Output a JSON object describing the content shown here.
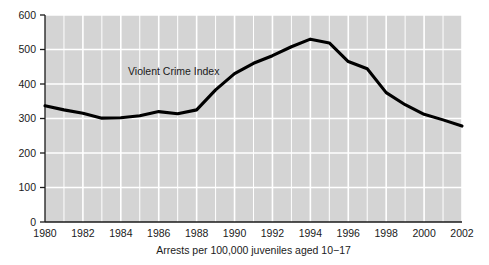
{
  "figure": {
    "background_color": "#ffffff",
    "plot_background_color": "#d4d4d4",
    "gridline_color": "#ffffff",
    "axis_color": "#1a1a1a",
    "series_color": "#000000"
  },
  "annotations": {
    "series_label": "Violent Crime Index"
  },
  "axes": {
    "x_title": "Arrests per 100,000 juveniles aged 10−17",
    "y_title": "",
    "y_tick_labels": [
      "0",
      "100",
      "200",
      "300",
      "400",
      "500",
      "600"
    ],
    "x_tick_labels": [
      "1980",
      "1982",
      "1984",
      "1986",
      "1988",
      "1990",
      "1992",
      "1994",
      "1996",
      "1998",
      "2000",
      "2002"
    ]
  },
  "chart_data": {
    "type": "line",
    "title": "",
    "subtitle": "",
    "xlabel": "Arrests per 100,000 juveniles aged 10−17",
    "ylabel": "",
    "xlim": [
      1980,
      2002
    ],
    "ylim": [
      0,
      600
    ],
    "grid": true,
    "legend_position": "inline-annotation",
    "x_tick_interval": 2,
    "y_tick_interval": 100,
    "x": [
      1980,
      1981,
      1982,
      1983,
      1984,
      1985,
      1986,
      1987,
      1988,
      1989,
      1990,
      1991,
      1992,
      1993,
      1994,
      1995,
      1996,
      1997,
      1998,
      1999,
      2000,
      2001,
      2002
    ],
    "series": [
      {
        "name": "Violent Crime Index",
        "color": "#000000",
        "values": [
          337,
          325,
          315,
          301,
          302,
          308,
          320,
          314,
          325,
          383,
          430,
          460,
          482,
          508,
          530,
          519,
          465,
          444,
          375,
          340,
          312,
          296,
          278
        ]
      }
    ]
  }
}
